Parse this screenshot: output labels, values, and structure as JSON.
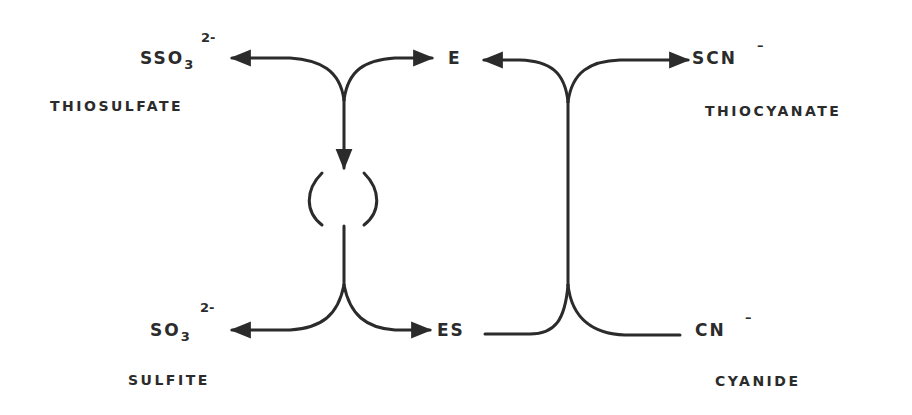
{
  "diagram": {
    "type": "enzyme reaction cycle (rhodanese ping-pong mechanism)",
    "colors": {
      "ink": "#2b2b2b",
      "background": "#ffffff"
    },
    "nodes": {
      "thiosulfate": {
        "formula": "SSO",
        "subscript": "3",
        "charge": "2-",
        "name": "THIOSULFATE"
      },
      "enzyme": {
        "label": "E"
      },
      "thiocyanate": {
        "formula": "SCN",
        "charge": "–",
        "name": "THIOCYANATE"
      },
      "sulfite": {
        "formula": "SO",
        "subscript": "3",
        "charge": "2-",
        "name": "SULFITE"
      },
      "enzyme_substrate": {
        "label": "ES"
      },
      "cyanide": {
        "formula": "CN",
        "charge": "–",
        "name": "CYANIDE"
      },
      "intermediate": {
        "label": "(   )"
      }
    },
    "edges": [
      {
        "from": "E",
        "to": "SSO3 2-",
        "note": "E releases to thiosulfate branch"
      },
      {
        "from": "junction-left-top",
        "to": "intermediate"
      },
      {
        "from": "intermediate",
        "to": "junction-left-bottom"
      },
      {
        "from": "junction-left-bottom",
        "to": "SO3 2-"
      },
      {
        "from": "junction-left-bottom",
        "to": "ES"
      },
      {
        "from": "ES",
        "to": "junction-right"
      },
      {
        "from": "CN-",
        "to": "junction-right"
      },
      {
        "from": "junction-right",
        "to": "E"
      },
      {
        "from": "junction-right",
        "to": "SCN-"
      }
    ]
  }
}
